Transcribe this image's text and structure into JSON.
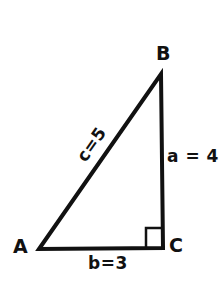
{
  "figure": {
    "background_color": "#ffffff",
    "stroke_color": "#111111",
    "vertices": [
      {
        "name": "A",
        "label": "A",
        "x": 39,
        "y": 249
      },
      {
        "name": "B",
        "label": "B",
        "x": 161,
        "y": 74
      },
      {
        "name": "C",
        "label": "C",
        "x": 163,
        "y": 248
      }
    ],
    "sides": [
      {
        "name": "a",
        "label": "a = 4",
        "value": 4,
        "opposite_vertex": "A",
        "from": "B",
        "to": "C",
        "orientation": "vertical"
      },
      {
        "name": "b",
        "label": "b=3",
        "value": 3,
        "opposite_vertex": "B",
        "from": "A",
        "to": "C",
        "orientation": "horizontal"
      },
      {
        "name": "c",
        "label": "c=5",
        "value": 5,
        "opposite_vertex": "C",
        "from": "A",
        "to": "B",
        "orientation": "diagonal",
        "rotation_deg": -55
      }
    ],
    "right_angle": {
      "at_vertex": "C",
      "marker": "square",
      "x": 146,
      "y": 228,
      "width": 16,
      "height": 19
    }
  }
}
